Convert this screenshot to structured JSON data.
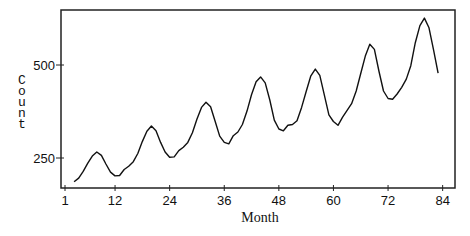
{
  "chart_data": {
    "type": "line",
    "title": "",
    "xlabel": "Month",
    "ylabel": "Count",
    "xlim": [
      0,
      85
    ],
    "ylim": [
      169,
      645
    ],
    "xticks": [
      1,
      12,
      24,
      36,
      48,
      60,
      72,
      84
    ],
    "yticks": [
      250,
      500
    ],
    "grid": false,
    "legend": null,
    "series": [
      {
        "name": "Count",
        "x": [
          3,
          4,
          5,
          6,
          7,
          8,
          9,
          10,
          11,
          12,
          13,
          14,
          15,
          16,
          17,
          18,
          19,
          20,
          21,
          22,
          23,
          24,
          25,
          26,
          27,
          28,
          29,
          30,
          31,
          32,
          33,
          34,
          35,
          36,
          37,
          38,
          39,
          40,
          41,
          42,
          43,
          44,
          45,
          46,
          47,
          48,
          49,
          50,
          51,
          52,
          53,
          54,
          55,
          56,
          57,
          58,
          59,
          60,
          61,
          62,
          63,
          64,
          65,
          66,
          67,
          68,
          69,
          70,
          71,
          72,
          73,
          74,
          75,
          76,
          77,
          78,
          79,
          80,
          81,
          82,
          83
        ],
        "values": [
          186,
          196,
          214,
          236,
          255,
          266,
          257,
          234,
          212,
          202,
          203,
          219,
          228,
          240,
          262,
          294,
          322,
          336,
          323,
          292,
          266,
          252,
          253,
          270,
          279,
          292,
          318,
          354,
          386,
          400,
          388,
          348,
          309,
          292,
          288,
          310,
          320,
          340,
          376,
          420,
          455,
          468,
          452,
          406,
          352,
          328,
          323,
          338,
          340,
          350,
          386,
          428,
          470,
          489,
          472,
          420,
          366,
          348,
          338,
          360,
          378,
          396,
          430,
          478,
          524,
          556,
          542,
          484,
          430,
          410,
          408,
          422,
          440,
          462,
          498,
          560,
          606,
          626,
          600,
          540,
          478
        ]
      }
    ]
  }
}
